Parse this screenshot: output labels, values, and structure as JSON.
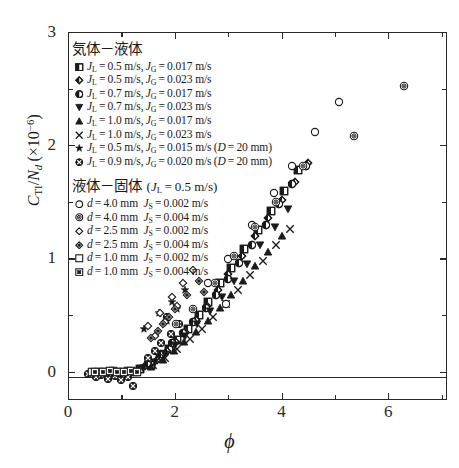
{
  "chart_data": {
    "type": "scatter",
    "title": "",
    "xlabel": "ϕ",
    "ylabel": "C_TI/N_d (×10⁻⁶)",
    "xlim": [
      0,
      7.1
    ],
    "ylim": [
      -0.25,
      3.0
    ],
    "xticks": [
      0,
      2,
      4,
      6
    ],
    "xticks_minor": [
      1,
      3,
      5,
      7
    ],
    "yticks": [
      0,
      1,
      2,
      3
    ],
    "yticks_minor": [
      0.5,
      1.5,
      2.5
    ],
    "grid": false,
    "legend_position": "upper-left inside axes",
    "series": [
      {
        "name": "gl1",
        "marker": "half-square",
        "label_prefix": "J_L=0.5 m/s, J_G=0.017 m/s",
        "points": [
          [
            1.35,
            0.02
          ],
          [
            1.55,
            0.06
          ],
          [
            1.72,
            0.12
          ],
          [
            1.9,
            0.2
          ],
          [
            2.05,
            0.28
          ],
          [
            2.25,
            0.38
          ],
          [
            2.45,
            0.5
          ],
          [
            2.62,
            0.62
          ],
          [
            2.85,
            0.78
          ],
          [
            3.05,
            0.92
          ],
          [
            3.3,
            1.08
          ],
          [
            3.55,
            1.25
          ],
          [
            3.8,
            1.42
          ],
          [
            4.05,
            1.6
          ],
          [
            4.3,
            1.78
          ]
        ]
      },
      {
        "name": "gl2",
        "marker": "half-diamond",
        "label_prefix": "J_L=0.5 m/s, J_G=0.023 m/s",
        "points": [
          [
            1.45,
            0.05
          ],
          [
            1.66,
            0.1
          ],
          [
            1.85,
            0.18
          ],
          [
            2.02,
            0.26
          ],
          [
            2.2,
            0.35
          ],
          [
            2.4,
            0.46
          ],
          [
            2.6,
            0.58
          ],
          [
            2.8,
            0.72
          ],
          [
            3.0,
            0.86
          ],
          [
            3.25,
            1.02
          ],
          [
            3.5,
            1.2
          ],
          [
            3.75,
            1.36
          ],
          [
            4.0,
            1.52
          ],
          [
            4.25,
            1.68
          ],
          [
            4.5,
            1.84
          ]
        ]
      },
      {
        "name": "gl3",
        "marker": "half-circle",
        "label_prefix": "J_L=0.7 m/s, J_G=0.017 m/s",
        "points": [
          [
            1.5,
            0.08
          ],
          [
            1.75,
            0.16
          ],
          [
            1.95,
            0.25
          ],
          [
            2.15,
            0.34
          ],
          [
            2.35,
            0.44
          ],
          [
            2.58,
            0.56
          ],
          [
            2.78,
            0.68
          ],
          [
            3.0,
            0.82
          ],
          [
            3.2,
            0.96
          ],
          [
            3.45,
            1.12
          ],
          [
            3.7,
            1.3
          ],
          [
            3.95,
            1.48
          ],
          [
            4.2,
            1.66
          ],
          [
            4.45,
            1.82
          ]
        ]
      },
      {
        "name": "gl4",
        "marker": "tri-down",
        "label_prefix": "J_L=0.7 m/s, J_G=0.023 m/s",
        "points": [
          [
            1.4,
            0.03
          ],
          [
            1.62,
            0.09
          ],
          [
            1.82,
            0.16
          ],
          [
            2.0,
            0.24
          ],
          [
            2.2,
            0.32
          ],
          [
            2.42,
            0.42
          ],
          [
            2.65,
            0.54
          ],
          [
            2.88,
            0.66
          ],
          [
            3.1,
            0.8
          ],
          [
            3.35,
            0.95
          ],
          [
            3.6,
            1.12
          ],
          [
            3.88,
            1.28
          ],
          [
            4.12,
            1.44
          ]
        ]
      },
      {
        "name": "gl5",
        "marker": "tri-up",
        "label_prefix": "J_L=1.0 m/s, J_G=0.017 m/s",
        "points": [
          [
            1.55,
            0.04
          ],
          [
            1.78,
            0.1
          ],
          [
            1.98,
            0.18
          ],
          [
            2.18,
            0.26
          ],
          [
            2.4,
            0.35
          ],
          [
            2.62,
            0.45
          ],
          [
            2.85,
            0.56
          ],
          [
            3.05,
            0.68
          ],
          [
            3.28,
            0.8
          ],
          [
            3.5,
            0.93
          ],
          [
            3.75,
            1.06
          ],
          [
            4.0,
            1.2
          ]
        ]
      },
      {
        "name": "gl6",
        "marker": "cross-x",
        "label_prefix": "J_L=1.0 m/s, J_G=0.023 m/s",
        "points": [
          [
            1.6,
            0.06
          ],
          [
            1.82,
            0.12
          ],
          [
            2.05,
            0.2
          ],
          [
            2.28,
            0.29
          ],
          [
            2.5,
            0.38
          ],
          [
            2.72,
            0.48
          ],
          [
            2.95,
            0.6
          ],
          [
            3.18,
            0.72
          ],
          [
            3.4,
            0.85
          ],
          [
            3.65,
            0.98
          ],
          [
            3.9,
            1.12
          ],
          [
            4.15,
            1.26
          ]
        ]
      },
      {
        "name": "gl7",
        "marker": "star",
        "label_prefix": "J_L=0.5 m/s, J_G=0.015 m/s (D=20 mm)",
        "points": [
          [
            1.42,
            0.38
          ],
          [
            1.7,
            0.52
          ],
          [
            1.95,
            0.62
          ],
          [
            2.2,
            0.72
          ],
          [
            2.05,
            0.55
          ],
          [
            1.85,
            0.45
          ]
        ]
      },
      {
        "name": "gl8",
        "marker": "circ-cross",
        "label_prefix": "J_L=0.9 m/s, J_G=0.020 m/s (D=20 mm)",
        "points": [
          [
            0.38,
            -0.02
          ],
          [
            0.52,
            -0.05
          ],
          [
            0.62,
            -0.03
          ],
          [
            0.75,
            -0.06
          ],
          [
            0.88,
            -0.04
          ],
          [
            1.0,
            -0.07
          ],
          [
            1.12,
            -0.05
          ],
          [
            1.22,
            -0.13
          ],
          [
            1.5,
            0.12
          ],
          [
            1.62,
            0.18
          ],
          [
            1.75,
            0.25
          ],
          [
            1.92,
            0.33
          ],
          [
            2.08,
            0.42
          ],
          [
            1.85,
            0.48
          ]
        ]
      },
      {
        "name": "ls1",
        "marker": "open-circle",
        "label_prefix": "d=4.0 mm, J_S=0.002 m/s",
        "points": [
          [
            2.62,
            0.78
          ],
          [
            3.0,
            1.0
          ],
          [
            3.45,
            1.3
          ],
          [
            3.85,
            1.58
          ],
          [
            4.2,
            1.82
          ],
          [
            4.62,
            2.12
          ],
          [
            5.08,
            2.38
          ],
          [
            2.95,
            0.6
          ]
        ]
      },
      {
        "name": "ls2",
        "marker": "bullseye",
        "label_prefix": "d=4.0 mm, J_S=0.004 m/s",
        "points": [
          [
            2.35,
            0.55
          ],
          [
            2.75,
            0.78
          ],
          [
            3.1,
            1.02
          ],
          [
            3.5,
            1.28
          ],
          [
            3.9,
            1.5
          ],
          [
            4.4,
            1.82
          ],
          [
            5.35,
            2.08
          ],
          [
            6.3,
            2.52
          ],
          [
            2.02,
            0.42
          ]
        ]
      },
      {
        "name": "ls3",
        "marker": "open-diamond",
        "label_prefix": "d=2.5 mm, J_S=0.002 m/s",
        "points": [
          [
            1.5,
            0.4
          ],
          [
            1.72,
            0.52
          ],
          [
            1.95,
            0.66
          ],
          [
            2.15,
            0.78
          ],
          [
            2.35,
            0.9
          ],
          [
            1.62,
            0.32
          ],
          [
            1.82,
            0.44
          ],
          [
            2.05,
            0.58
          ]
        ]
      },
      {
        "name": "ls4",
        "marker": "diamond-in",
        "label_prefix": "d=2.5 mm, J_S=0.004 m/s",
        "points": [
          [
            1.55,
            0.3
          ],
          [
            1.78,
            0.42
          ],
          [
            2.0,
            0.55
          ],
          [
            2.22,
            0.68
          ],
          [
            2.45,
            0.8
          ],
          [
            1.68,
            0.36
          ],
          [
            1.9,
            0.48
          ],
          [
            2.55,
            0.7
          ]
        ]
      },
      {
        "name": "ls5",
        "marker": "open-square",
        "label_prefix": "d=1.0 mm, J_S=0.002 m/s",
        "points": [
          [
            0.45,
            0.0
          ],
          [
            0.58,
            0.0
          ],
          [
            0.7,
            0.0
          ],
          [
            0.85,
            0.01
          ],
          [
            0.98,
            0.0
          ],
          [
            1.12,
            0.01
          ],
          [
            1.25,
            0.0
          ]
        ]
      },
      {
        "name": "ls6",
        "marker": "square-in",
        "label_prefix": "d=1.0 mm, J_S=0.004 m/s",
        "points": [
          [
            0.5,
            0.0
          ],
          [
            0.65,
            0.0
          ],
          [
            0.78,
            0.01
          ],
          [
            0.92,
            0.0
          ],
          [
            1.05,
            0.0
          ],
          [
            1.18,
            0.01
          ],
          [
            1.3,
            0.0
          ]
        ]
      }
    ]
  },
  "axes": {
    "ylabel_parts": {
      "c": "C",
      "ti": "TI",
      "slash": "/",
      "n": "N",
      "d": "d",
      "open": "(",
      "times": "×10",
      "exp": "−6",
      "close": ")"
    },
    "xlabel": "ϕ",
    "xtick_labels": [
      "0",
      "2",
      "4",
      "6"
    ],
    "ytick_labels": [
      "0",
      "1",
      "2",
      "3"
    ]
  },
  "legend": {
    "section1": {
      "heading": "気体－液体",
      "items": [
        {
          "glyph": "half-square",
          "jl": "0.5",
          "jg": "0.017",
          "extra": ""
        },
        {
          "glyph": "half-diamond",
          "jl": "0.5",
          "jg": "0.023",
          "extra": ""
        },
        {
          "glyph": "half-circle",
          "jl": "0.7",
          "jg": "0.017",
          "extra": ""
        },
        {
          "glyph": "tri-down",
          "jl": "0.7",
          "jg": "0.023",
          "extra": ""
        },
        {
          "glyph": "tri-up",
          "jl": "1.0",
          "jg": "0.017",
          "extra": ""
        },
        {
          "glyph": "cross-x",
          "jl": "1.0",
          "jg": "0.023",
          "extra": ""
        },
        {
          "glyph": "star",
          "jl": "0.5",
          "jg": "0.015",
          "extra": "(D=20 mm)"
        },
        {
          "glyph": "circ-cross",
          "jl": "0.9",
          "jg": "0.020",
          "extra": "(D=20 mm)"
        }
      ]
    },
    "section2": {
      "heading_main": "液体－固体",
      "heading_cond": "(J_L=0.5 m/s)",
      "items": [
        {
          "glyph": "open-circle",
          "d": "4.0",
          "js": "0.002"
        },
        {
          "glyph": "bullseye",
          "d": "4.0",
          "js": "0.004"
        },
        {
          "glyph": "open-diamond",
          "d": "2.5",
          "js": "0.002"
        },
        {
          "glyph": "diamond-in",
          "d": "2.5",
          "js": "0.004"
        },
        {
          "glyph": "open-square",
          "d": "1.0",
          "js": "0.002"
        },
        {
          "glyph": "square-in",
          "d": "1.0",
          "js": "0.004"
        }
      ]
    }
  }
}
